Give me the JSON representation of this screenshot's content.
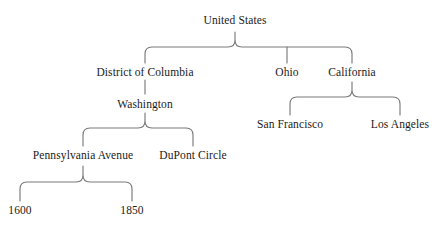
{
  "diagram": {
    "type": "tree",
    "line_color": "#7a7a7a",
    "text_color": "#1b1b1b",
    "background_color": "#ffffff",
    "nodes": {
      "root": {
        "label": "United States",
        "x": 235,
        "y": 22
      },
      "district_of_columbia": {
        "label": "District of Columbia",
        "x": 145,
        "y": 74
      },
      "ohio": {
        "label": "Ohio",
        "x": 287,
        "y": 74
      },
      "california": {
        "label": "California",
        "x": 352,
        "y": 74
      },
      "washington": {
        "label": "Washington",
        "x": 145,
        "y": 106
      },
      "san_francisco": {
        "label": "San Francisco",
        "x": 290,
        "y": 126
      },
      "los_angeles": {
        "label": "Los Angeles",
        "x": 400,
        "y": 126
      },
      "pennsylvania_avenue": {
        "label": "Pennsylvania Avenue",
        "x": 83,
        "y": 157
      },
      "dupont_circle": {
        "label": "DuPont Circle",
        "x": 193,
        "y": 157
      },
      "address_1600": {
        "label": "1600",
        "x": 20,
        "y": 212
      },
      "address_1850": {
        "label": "1850",
        "x": 132,
        "y": 212
      }
    },
    "edges": [
      {
        "parent": "root",
        "children": [
          "district_of_columbia",
          "ohio",
          "california"
        ],
        "style": "brace"
      },
      {
        "parent": "district_of_columbia",
        "children": [
          "washington"
        ],
        "style": "line"
      },
      {
        "parent": "california",
        "children": [
          "san_francisco",
          "los_angeles"
        ],
        "style": "brace"
      },
      {
        "parent": "washington",
        "children": [
          "pennsylvania_avenue",
          "dupont_circle"
        ],
        "style": "brace"
      },
      {
        "parent": "pennsylvania_avenue",
        "children": [
          "address_1600",
          "address_1850"
        ],
        "style": "brace"
      }
    ]
  }
}
